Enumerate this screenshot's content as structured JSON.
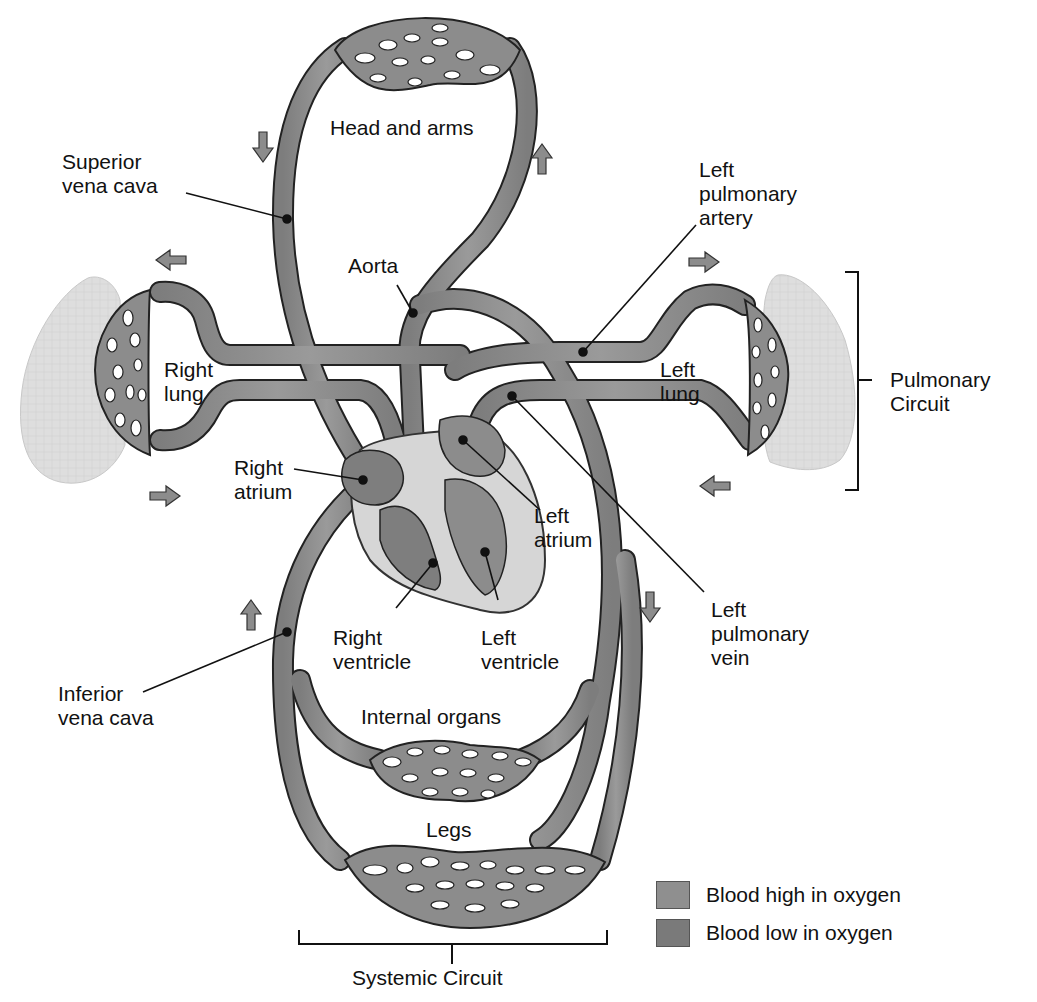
{
  "colors": {
    "vessel_high_oxygen": "#8f8f8f",
    "vessel_low_oxygen": "#7e7e7e",
    "vessel_outline": "#222222",
    "lung_tissue": "#dcdcdc",
    "heart_wall": "#d9d9d9",
    "background": "#ffffff"
  },
  "labels": {
    "head_and_arms": "Head and arms",
    "superior_vena_cava": "Superior\nvena cava",
    "left_pulmonary_artery": "Left\npulmonary\nartery",
    "aorta": "Aorta",
    "right_lung": "Right\nlung",
    "left_lung": "Left\nlung",
    "pulmonary_circuit": "Pulmonary\nCircuit",
    "right_atrium": "Right\natrium",
    "left_atrium": "Left\natrium",
    "right_ventricle": "Right\nventricle",
    "left_ventricle": "Left\nventricle",
    "left_pulmonary_vein": "Left\npulmonary\nvein",
    "inferior_vena_cava": "Inferior\nvena cava",
    "internal_organs": "Internal organs",
    "legs": "Legs",
    "systemic_circuit": "Systemic Circuit"
  },
  "legend": {
    "items": [
      {
        "label": "Blood high in oxygen",
        "color": "#8f8f8f"
      },
      {
        "label": "Blood low in oxygen",
        "color": "#7a7a7a"
      }
    ]
  },
  "flow_arrows": [
    {
      "name": "down-arrow-superior",
      "direction": "down"
    },
    {
      "name": "up-arrow-head",
      "direction": "up"
    },
    {
      "name": "left-arrow-right-lung-out",
      "direction": "left"
    },
    {
      "name": "right-arrow-right-lung-in",
      "direction": "right"
    },
    {
      "name": "right-arrow-left-lung-in",
      "direction": "right"
    },
    {
      "name": "left-arrow-left-lung-out",
      "direction": "left"
    },
    {
      "name": "up-arrow-inferior",
      "direction": "up"
    },
    {
      "name": "down-arrow-descending",
      "direction": "down"
    }
  ]
}
